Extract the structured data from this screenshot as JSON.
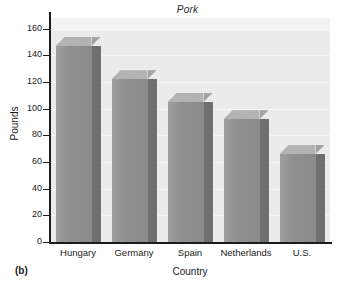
{
  "figure": {
    "panel_label": "(b)"
  },
  "chart_data": {
    "type": "bar",
    "title": "Pork",
    "xlabel": "Country",
    "ylabel": "Pounds",
    "categories": [
      "Hungary",
      "Germany",
      "Spain",
      "Netherlands",
      "U.S."
    ],
    "values": [
      147,
      122,
      105,
      92,
      66
    ],
    "ylim": [
      0,
      168
    ],
    "yticks": [
      0,
      20,
      40,
      60,
      80,
      100,
      120,
      140,
      160
    ],
    "ytick_labels": [
      "0",
      "20",
      "40",
      "60",
      "80",
      "100",
      "120",
      "140",
      "160"
    ],
    "grid": true,
    "legend": null,
    "style": {
      "bar_front_color": "#8f8f8f",
      "bar_side_color": "#6f6f6f",
      "bar_top_color": "#b3b3b3",
      "plot_background": "#ebebeb",
      "axis_color": "#1c1c1c",
      "text_color": "#1a1a1a"
    }
  }
}
